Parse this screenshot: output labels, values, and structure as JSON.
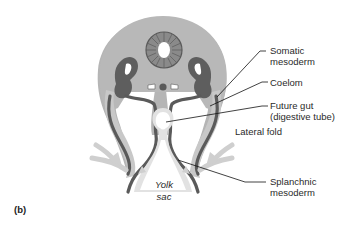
{
  "figure": {
    "panel_label": "(b)",
    "colors": {
      "outer_tissue": "#b5b5b5",
      "somatic_band": "#c8c8c8",
      "dark_mesoderm": "#5a5a5a",
      "neural_tube": "#8a8a8a",
      "endoderm_light": "#dedede",
      "arrow": "#cfcfcf",
      "leader_line": "#111111"
    },
    "labels": {
      "somatic": {
        "line1": "Somatic",
        "line2": "mesoderm"
      },
      "coelom": {
        "line1": "Coelom"
      },
      "future_gut": {
        "line1": "Future gut",
        "line2": "(digestive tube)"
      },
      "lateral_fold": {
        "line1": "Lateral fold"
      },
      "splanchnic": {
        "line1": "Splanchnic",
        "line2": "mesoderm"
      },
      "yolk_sac": {
        "line1": "Yolk",
        "line2": "sac"
      }
    }
  }
}
